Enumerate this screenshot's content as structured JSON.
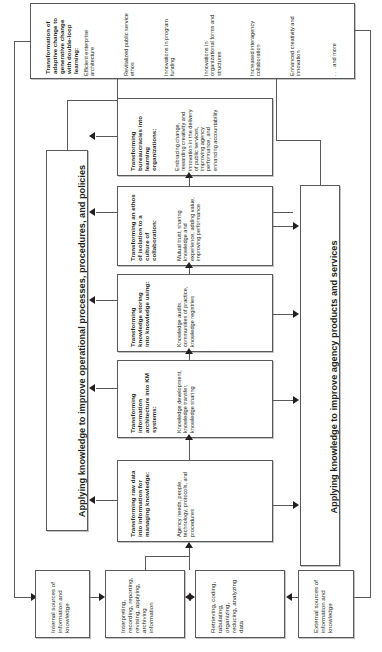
{
  "diagram": {
    "title_top": "Transformation of adaptive change to generative change with double-loop learning:",
    "outcomes": [
      "Efficient enterprise architecture",
      "Revitalized public service ethos",
      "Innovations in program funding",
      "Innovations in organizational forms and structures",
      "Increased interagency collaboration",
      "Enhanced creativity and innovation",
      ". . . and more"
    ],
    "banner_left": "Applying knowledge to improve operational processes, procedures, and policies",
    "banner_right": "Applying knowledge to improve agency products and services",
    "stages": [
      {
        "title": "Transforming bureaucracies into learning organizations:",
        "items": "Embracing change, rewarding creativity and innovation in the delivery of public services, improving agency performance, and enhancing accountability"
      },
      {
        "title": "Transforming an ethos of isolation to a culture of collaboration:",
        "items": "Mutual trust, sharing knowledge and experience, adding value, improving performance"
      },
      {
        "title": "Transforming knowledge storing into knowledge using:",
        "items": "Knowledge audits, communities of practice, knowledge registries"
      },
      {
        "title": "Transforming information architecture into KM systems:",
        "items": "Knowledge development, knowledge transfer, knowledge sharing"
      },
      {
        "title": "Transforming raw data into information for managing knowledge:",
        "items": "Agency needs, people, technology, protocols, and procedures"
      }
    ],
    "sources": [
      {
        "label": "Internal sources of information and knowledge"
      },
      {
        "label": "Interpreting, recording, reporting, revising, applying, archiving information"
      },
      {
        "label": "Retrieving, coding, tabulating, organizing, reducing, analyzing data"
      },
      {
        "label": "External sources of information and knowledge"
      }
    ]
  }
}
